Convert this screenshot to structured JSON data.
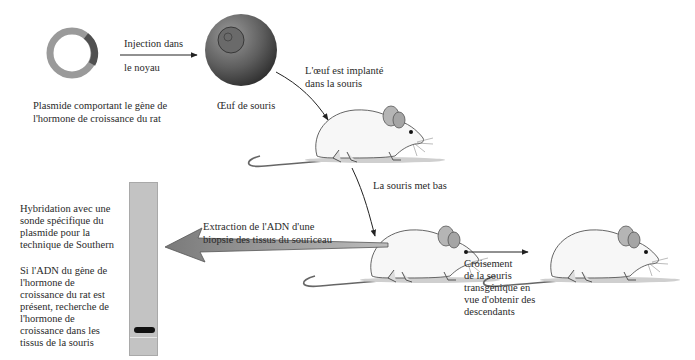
{
  "plasmid": {
    "caption_line1": "Plasmide comportant le gène de",
    "caption_line2": "l'hormone de croissance du rat",
    "ring_color": "#9a9a9a",
    "gene_segment_color": "#505050"
  },
  "injection": {
    "line1": "Injection dans",
    "line2": "le noyau"
  },
  "egg": {
    "caption": "Œuf de souris"
  },
  "implant": {
    "line1": "L'œuf est implanté",
    "line2": "dans la souris"
  },
  "birth": {
    "label": "La souris met bas"
  },
  "extraction": {
    "line1": "Extraction de l'ADN d'une",
    "line2": "biopsie des tissus du souriceau"
  },
  "hybridation": {
    "lines": [
      "Hybridation avec une",
      "sonde spécifique du",
      "plasmide pour la",
      "technique de Southern"
    ]
  },
  "detection": {
    "lines": [
      "Si l'ADN du gène de",
      "l'hormone de",
      "croissance du rat est",
      "présent, recherche de",
      "l'hormone de",
      "croissance dans les",
      "tissus de la souris"
    ]
  },
  "crossing": {
    "lines": [
      "Croisement",
      "de la souris",
      "transgénique en",
      "vue d'obtenir des",
      "descendants"
    ]
  }
}
